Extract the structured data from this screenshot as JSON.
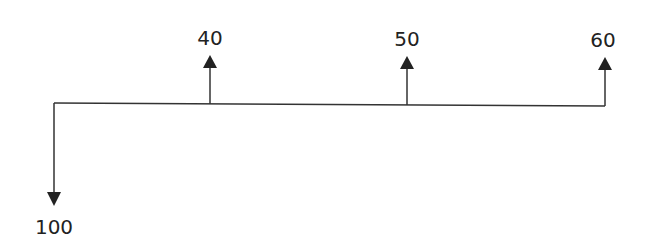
{
  "diagram": {
    "type": "cash-flow-diagram",
    "timeline": {
      "x_start": 54,
      "x_end": 605,
      "y": 104
    },
    "flows": [
      {
        "label": "100",
        "direction": "down",
        "x": 54
      },
      {
        "label": "40",
        "direction": "up",
        "x": 210
      },
      {
        "label": "50",
        "direction": "up",
        "x": 407
      },
      {
        "label": "60",
        "direction": "up",
        "x": 605
      }
    ],
    "colors": {
      "line": "#333333",
      "text": "#222222"
    }
  }
}
